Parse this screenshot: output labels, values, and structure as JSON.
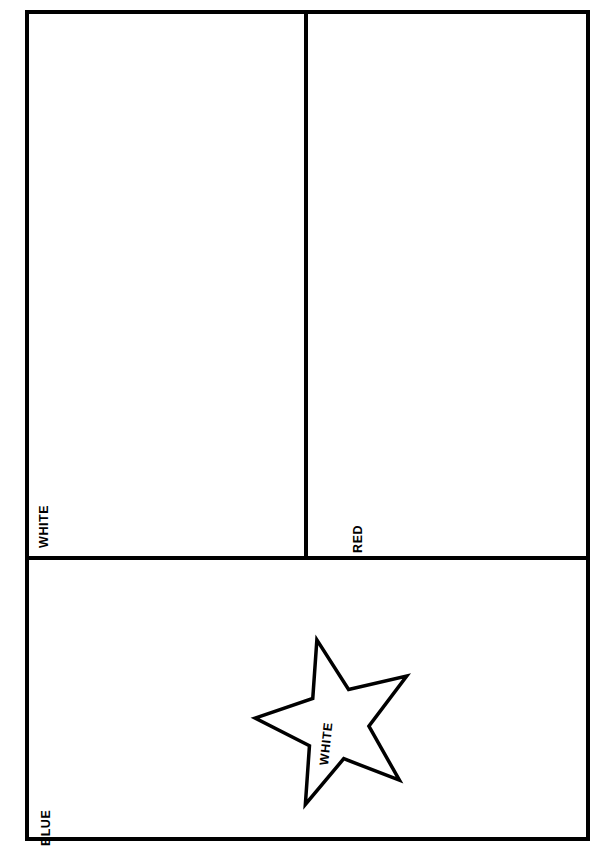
{
  "diagram": {
    "orientation": "rotated-90-ccw",
    "stroke_color": "#000000",
    "background_color": "#ffffff",
    "frame": {
      "border_width_px": 4
    },
    "panels": [
      {
        "id": "white-field",
        "label": "WHITE",
        "fill_color": "#ffffff",
        "position": "upper-left"
      },
      {
        "id": "red-field",
        "label": "RED",
        "fill_color": "#ffffff",
        "position": "upper-right"
      },
      {
        "id": "blue-field",
        "label": "BLUE",
        "fill_color": "#ffffff",
        "position": "lower-full-width"
      }
    ],
    "star": {
      "label": "WHITE",
      "points": 5,
      "fill_color": "#ffffff",
      "stroke_color": "#000000",
      "stroke_width_px": 3,
      "rotation_deg": -90,
      "polygon_points": "86,6 113,70 180,70 126,110 146,175 86,136 27,175 47,110 -8,70 59,70"
    }
  }
}
